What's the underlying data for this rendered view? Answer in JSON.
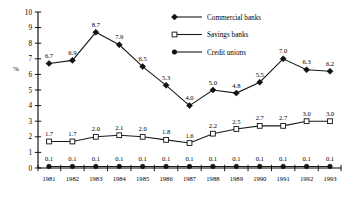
{
  "chart_data": {
    "type": "line",
    "title": "",
    "xlabel": "",
    "ylabel": "%",
    "ylim": [
      0,
      10
    ],
    "yticks": [
      0,
      1,
      2,
      3,
      4,
      5,
      6,
      7,
      8,
      9,
      10
    ],
    "grid": false,
    "legend_position": "top-right",
    "categories": [
      "1981",
      "1982",
      "1983",
      "1984",
      "1985",
      "1986",
      "1987",
      "1988",
      "1989",
      "1990",
      "1991",
      "1992",
      "1993"
    ],
    "series": [
      {
        "name": "Commercial banks",
        "marker": "filled-diamond",
        "values": [
          6.7,
          6.9,
          8.7,
          7.9,
          6.5,
          5.3,
          4.0,
          5.0,
          4.8,
          5.5,
          7.0,
          6.3,
          6.2
        ],
        "labels": [
          "6.7",
          "6.9",
          "8.7",
          "7.9",
          "6.5",
          "5.3",
          "4.0",
          "5.0",
          "4.8",
          "5.5",
          "7.0",
          "6.3",
          "6.2"
        ]
      },
      {
        "name": "Savings banks",
        "marker": "open-square",
        "values": [
          1.7,
          1.7,
          2.0,
          2.1,
          2.0,
          1.8,
          1.6,
          2.2,
          2.5,
          2.7,
          2.7,
          3.0,
          3.0
        ],
        "labels": [
          "1.7",
          "1.7",
          "2.0",
          "2.1",
          "2.0",
          "1.8",
          "1.6",
          "2.2",
          "2.5",
          "2.7",
          "2.7",
          "3.0",
          "3.0"
        ]
      },
      {
        "name": "Credit unions",
        "marker": "filled-circle",
        "values": [
          0.1,
          0.1,
          0.1,
          0.1,
          0.1,
          0.1,
          0.1,
          0.1,
          0.1,
          0.1,
          0.1,
          0.1,
          0.1
        ],
        "labels": [
          "0.1",
          "0.1",
          "0.1",
          "0.1",
          "0.1",
          "0.1",
          "0.1",
          "0.1",
          "0.1",
          "0.1",
          "0.1",
          "0.1",
          "0.1"
        ]
      }
    ],
    "colors": {
      "line": "#1a1a1a",
      "axis": "#000000",
      "background": "#ffffff"
    }
  }
}
